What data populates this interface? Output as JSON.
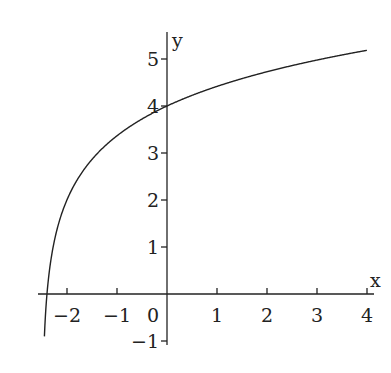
{
  "chart_data": {
    "type": "line",
    "title": "",
    "xlabel": "x",
    "ylabel": "y",
    "x_ticks": [
      "-2",
      "-1",
      "0",
      "1",
      "2",
      "3",
      "4"
    ],
    "y_ticks": [
      "-1",
      "1",
      "2",
      "3",
      "4",
      "5"
    ],
    "xlim": [
      -2.5,
      4.1
    ],
    "ylim": [
      -1,
      5.5
    ],
    "grid": false,
    "legend": null,
    "series": [
      {
        "name": "f(x)",
        "description": "Logarithmic curve with vertical asymptote near x = -2.5, y-intercept 4",
        "x": [
          -2.45,
          -2.4,
          -2.3,
          -2.2,
          -2.0,
          -1.75,
          -1.5,
          -1.0,
          -0.5,
          0,
          0.5,
          1,
          1.5,
          2,
          2.5,
          3,
          3.5,
          4
        ],
        "y": [
          -0.98,
          0.0,
          0.78,
          1.6,
          2.0,
          2.51,
          2.86,
          3.37,
          3.72,
          4.0,
          4.23,
          4.42,
          4.58,
          4.73,
          4.86,
          4.98,
          5.09,
          5.18
        ]
      }
    ]
  },
  "axes": {
    "x_label": "x",
    "y_label": "y",
    "x_tick_labels": [
      "−2",
      "−1",
      "0",
      "1",
      "2",
      "3",
      "4"
    ],
    "y_tick_labels": [
      "−1",
      "1",
      "2",
      "3",
      "4",
      "5"
    ]
  }
}
